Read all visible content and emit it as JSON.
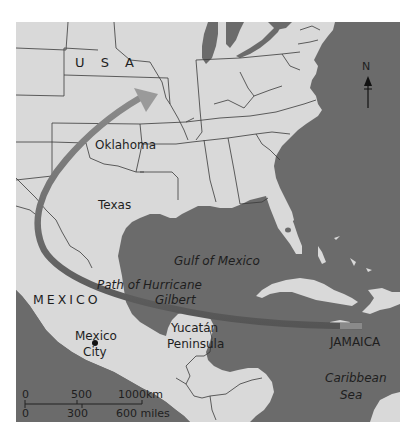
{
  "map": {
    "colors": {
      "land": "#d9d9d9",
      "water": "#6b6b6b",
      "border": "#3a3a3a",
      "track": "#5a5a5a",
      "arrow_head": "#8c8c8c",
      "text": "#1e1e1e"
    },
    "labels": {
      "usa": "U S A",
      "oklahoma": "Oklahoma",
      "texas": "Texas",
      "gulf": "Gulf of Mexico",
      "path_line1": "Path of Hurricane",
      "path_line2": "Gilbert",
      "mexico": "MEXICO",
      "mexico_city_line1": "Mexico",
      "mexico_city_line2": "City",
      "yucatan_line1": "Yucatán",
      "yucatan_line2": "Peninsula",
      "jamaica": "JAMAICA",
      "caribbean_line1": "Caribbean",
      "caribbean_line2": "Sea"
    },
    "north_arrow": {
      "label": "N",
      "icon": "north-arrow-icon"
    },
    "scale_bar": {
      "km_ticks": [
        "0",
        "500",
        "1000km"
      ],
      "mile_ticks": [
        "0",
        "300",
        "600 miles"
      ]
    },
    "hurricane_track": {
      "name": "Path of Hurricane Gilbert",
      "from": "Jamaica",
      "to": "Midwest USA"
    }
  }
}
